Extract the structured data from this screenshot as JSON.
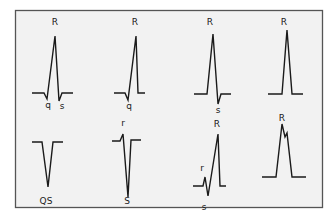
{
  "figure": {
    "frame": {
      "background": "#f2f2f2",
      "border": "#555555"
    },
    "panels": [
      {
        "id": "qRs",
        "labels": [
          {
            "text": "R",
            "x": 55,
            "y": 25
          },
          {
            "text": "q",
            "x": 48,
            "y": 108
          },
          {
            "text": "s",
            "x": 62,
            "y": 109
          }
        ],
        "path": "M32,93 L44,93 L47,99 L55,36 L59,101 L62,93 L73,93"
      },
      {
        "id": "qR",
        "labels": [
          {
            "text": "R",
            "x": 135,
            "y": 25
          },
          {
            "text": "q",
            "x": 129,
            "y": 109
          }
        ],
        "path": "M114,93 L125,93 L128,100 L136,36 L138,93 L145,93"
      },
      {
        "id": "Rs",
        "labels": [
          {
            "text": "R",
            "x": 210,
            "y": 25
          },
          {
            "text": "s",
            "x": 218,
            "y": 113
          }
        ],
        "path": "M194,94 L207,94 L213,34 L218,104 L221,94 L231,94"
      },
      {
        "id": "R",
        "labels": [
          {
            "text": "R",
            "x": 284,
            "y": 25
          }
        ],
        "path": "M268,94 L282,94 L287,30 L292,94 L303,94"
      },
      {
        "id": "QS",
        "labels": [
          {
            "text": "QS",
            "x": 46,
            "y": 204
          }
        ],
        "path": "M32,142 L42,142 L48,187 L53,142 L63,142"
      },
      {
        "id": "rS",
        "labels": [
          {
            "text": "r",
            "x": 123,
            "y": 126
          },
          {
            "text": "S",
            "x": 127,
            "y": 204
          }
        ],
        "path": "M112,141 L120,141 L123,134 L128,197 L131,140 L141,140"
      },
      {
        "id": "rSR",
        "labels": [
          {
            "text": "R",
            "x": 217,
            "y": 127
          },
          {
            "text": "r",
            "x": 202,
            "y": 171
          },
          {
            "text": "s",
            "x": 204,
            "y": 210
          }
        ],
        "path": "M193,186 L203,186 L205,177 L208,196 L218,134 L220,186 L226,186"
      },
      {
        "id": "R-notched",
        "labels": [
          {
            "text": "R",
            "x": 282,
            "y": 121
          }
        ],
        "path": "M262,177 L276,177 L282,124 L285,137 L287,133 L292,177 L306,177"
      }
    ]
  }
}
